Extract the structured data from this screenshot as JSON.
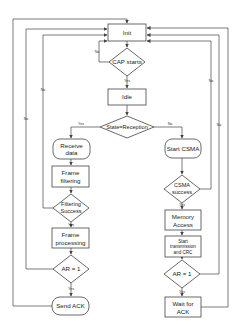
{
  "diagram": {
    "type": "flowchart",
    "colors": {
      "stroke": "#444444",
      "fill": "#ffffff",
      "text": "#222222"
    },
    "nodes": {
      "init": {
        "label": "Init",
        "shape": "rect"
      },
      "cap_starts": {
        "label": "CAP starts",
        "shape": "diamond"
      },
      "idle": {
        "label": "Idle",
        "shape": "rect"
      },
      "state_reception": {
        "label": "State=Reception",
        "shape": "diamond"
      },
      "receive_data": {
        "line1": "Receive",
        "line2": "data",
        "shape": "rounded"
      },
      "frame_filtering": {
        "line1": "Frame",
        "line2": "filtering",
        "shape": "rect"
      },
      "filtering_success": {
        "line1": "Filtering",
        "line2": "Success",
        "shape": "diamond"
      },
      "frame_processing": {
        "line1": "Frame",
        "line2": "processing",
        "shape": "rect"
      },
      "ar_left": {
        "label": "AR = 1",
        "shape": "diamond"
      },
      "send_ack": {
        "label": "Send ACK",
        "shape": "rounded"
      },
      "start_csma": {
        "label": "Start CSMA",
        "shape": "rounded"
      },
      "csma_success": {
        "line1": "CSMA",
        "line2": "success",
        "shape": "diamond"
      },
      "memory_access": {
        "line1": "Memory",
        "line2": "Access",
        "shape": "rect"
      },
      "start_tx": {
        "line1": "Start",
        "line2": "transmission",
        "line3": "and CRC",
        "shape": "rect"
      },
      "ar_right": {
        "label": "AR = 1",
        "shape": "diamond"
      },
      "wait_ack": {
        "line1": "Wait for",
        "line2": "ACK",
        "shape": "rect"
      }
    },
    "edge_labels": {
      "cap_no": "No",
      "cap_yes": "Yes",
      "state_yes": "Yes",
      "state_no": "No",
      "filter_no": "No",
      "filter_yes": "Yes",
      "ar_left_no": "No",
      "ar_left_yes": "Yes",
      "csma_no": "No",
      "csma_yes": "Yes",
      "ar_right_no": "No",
      "ar_right_yes": "Yes"
    }
  }
}
